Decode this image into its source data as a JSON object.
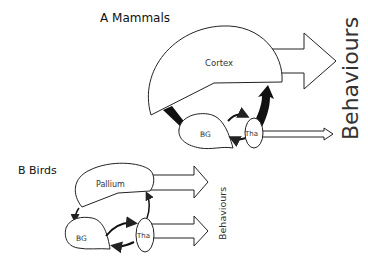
{
  "panels": {
    "mammals": {
      "title": "A Mammals",
      "cortex_label": "Cortex",
      "bg_label": "BG",
      "tha_label": "Tha",
      "output_label": "Behaviours"
    },
    "birds": {
      "title": "B Birds",
      "pallium_label": "Pallium",
      "bg_label": "BG",
      "tha_label": "Tha",
      "output_label": "Behaviours"
    }
  },
  "colors": {
    "stroke": "#222222",
    "fill": "#ffffff",
    "text": "#333333"
  }
}
